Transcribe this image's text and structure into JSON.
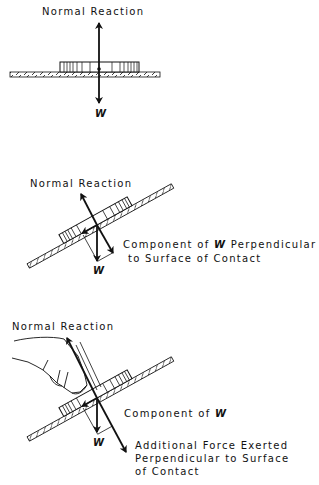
{
  "figures": [
    {
      "id": "flat",
      "labels": {
        "normal": "Normal Reaction",
        "weight": "W"
      }
    },
    {
      "id": "incline",
      "labels": {
        "normal": "Normal Reaction",
        "weight": "W",
        "component_line1_a": "Component of ",
        "component_line1_w": "W",
        "component_line1_b": " Perpendicular",
        "component_line2": "to Surface of Contact"
      }
    },
    {
      "id": "incline-with-finger",
      "labels": {
        "normal": "Normal Reaction",
        "weight": "W",
        "component_a": "Component of ",
        "component_w": "W",
        "additional_line1": "Additional Force Exerted",
        "additional_line2": "Perpendicular to Surface",
        "additional_line3": "of Contact"
      }
    }
  ],
  "colors": {
    "ink": "#111111",
    "background": "#ffffff"
  }
}
